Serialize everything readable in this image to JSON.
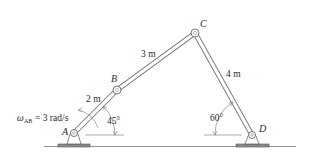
{
  "joints": {
    "A": {
      "label": "A",
      "x": 74,
      "y": 133
    },
    "B": {
      "label": "B",
      "x": 117,
      "y": 90
    },
    "C": {
      "label": "C",
      "x": 195,
      "y": 33
    },
    "D": {
      "label": "D",
      "x": 252,
      "y": 135
    }
  },
  "links": {
    "AB": {
      "length_label": "2 m"
    },
    "BC": {
      "length_label": "3 m"
    },
    "CD": {
      "length_label": "4 m"
    }
  },
  "angles": {
    "A": {
      "label": "45°"
    },
    "D": {
      "label": "60°"
    }
  },
  "angular_velocity": {
    "symbol": "ω",
    "subscript": "AB",
    "value_text": "= 3 rad/s"
  },
  "colors": {
    "link_stroke": "#6b6b6b",
    "link_fill": "#ffffff",
    "ground": "#555555",
    "text": "#2a2a2a"
  }
}
